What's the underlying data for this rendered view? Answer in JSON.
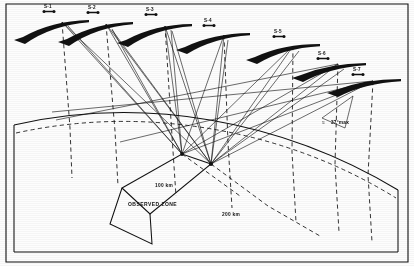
{
  "figure": {
    "kind": "technical-line-diagram",
    "background_color": "#fdfdfd",
    "ink_color": "#111111"
  },
  "satellites": [
    {
      "id": "sat-1",
      "label": "S-1",
      "label_x": 48,
      "label_y": 9,
      "tip_x": 89,
      "tip_y": 20,
      "tail_x": 14,
      "tail_y": 40,
      "bow": -9
    },
    {
      "id": "sat-2",
      "label": "S-2",
      "label_x": 92,
      "label_y": 10,
      "tip_x": 133,
      "tip_y": 22,
      "tail_x": 58,
      "tail_y": 42,
      "bow": -9
    },
    {
      "id": "sat-3",
      "label": "S-3",
      "label_x": 150,
      "label_y": 12,
      "tip_x": 192,
      "tip_y": 24,
      "tail_x": 117,
      "tail_y": 43,
      "bow": -9
    },
    {
      "id": "sat-4",
      "label": "S-4",
      "label_x": 208,
      "label_y": 23,
      "tip_x": 250,
      "tip_y": 33,
      "tail_x": 176,
      "tail_y": 50,
      "bow": -8
    },
    {
      "id": "sat-5",
      "label": "S-5",
      "label_x": 278,
      "label_y": 34,
      "tip_x": 320,
      "tip_y": 44,
      "tail_x": 246,
      "tail_y": 60,
      "bow": -8
    },
    {
      "id": "sat-6",
      "label": "S-6",
      "label_x": 322,
      "label_y": 56,
      "tip_x": 366,
      "tip_y": 63,
      "tail_x": 292,
      "tail_y": 78,
      "bow": -7
    },
    {
      "id": "sat-7",
      "label": "S-7",
      "label_x": 357,
      "label_y": 72,
      "tip_x": 401,
      "tip_y": 79,
      "tail_x": 327,
      "tail_y": 93,
      "bow": -7
    }
  ],
  "ground_stations": [
    {
      "id": "station-a",
      "x": 182,
      "y": 154
    },
    {
      "id": "station-b",
      "x": 211,
      "y": 164
    }
  ],
  "annotations": {
    "observed_zone": {
      "text": "OBSERVED ZONE",
      "x": 128,
      "y": 206
    },
    "range_inner": {
      "text": "100 km",
      "x": 155,
      "y": 187
    },
    "range_outer": {
      "text": "200 km",
      "x": 222,
      "y": 216
    },
    "max_angle": {
      "text": "37°max",
      "x": 332,
      "y": 124,
      "prefix": "≈"
    }
  },
  "earth_block": {
    "description": "curved earth surface rendered as a perspective slab",
    "surface_label": "earth-surface-arc",
    "left_edge_x": 14,
    "right_edge_x": 398,
    "baseline_y": 252
  }
}
